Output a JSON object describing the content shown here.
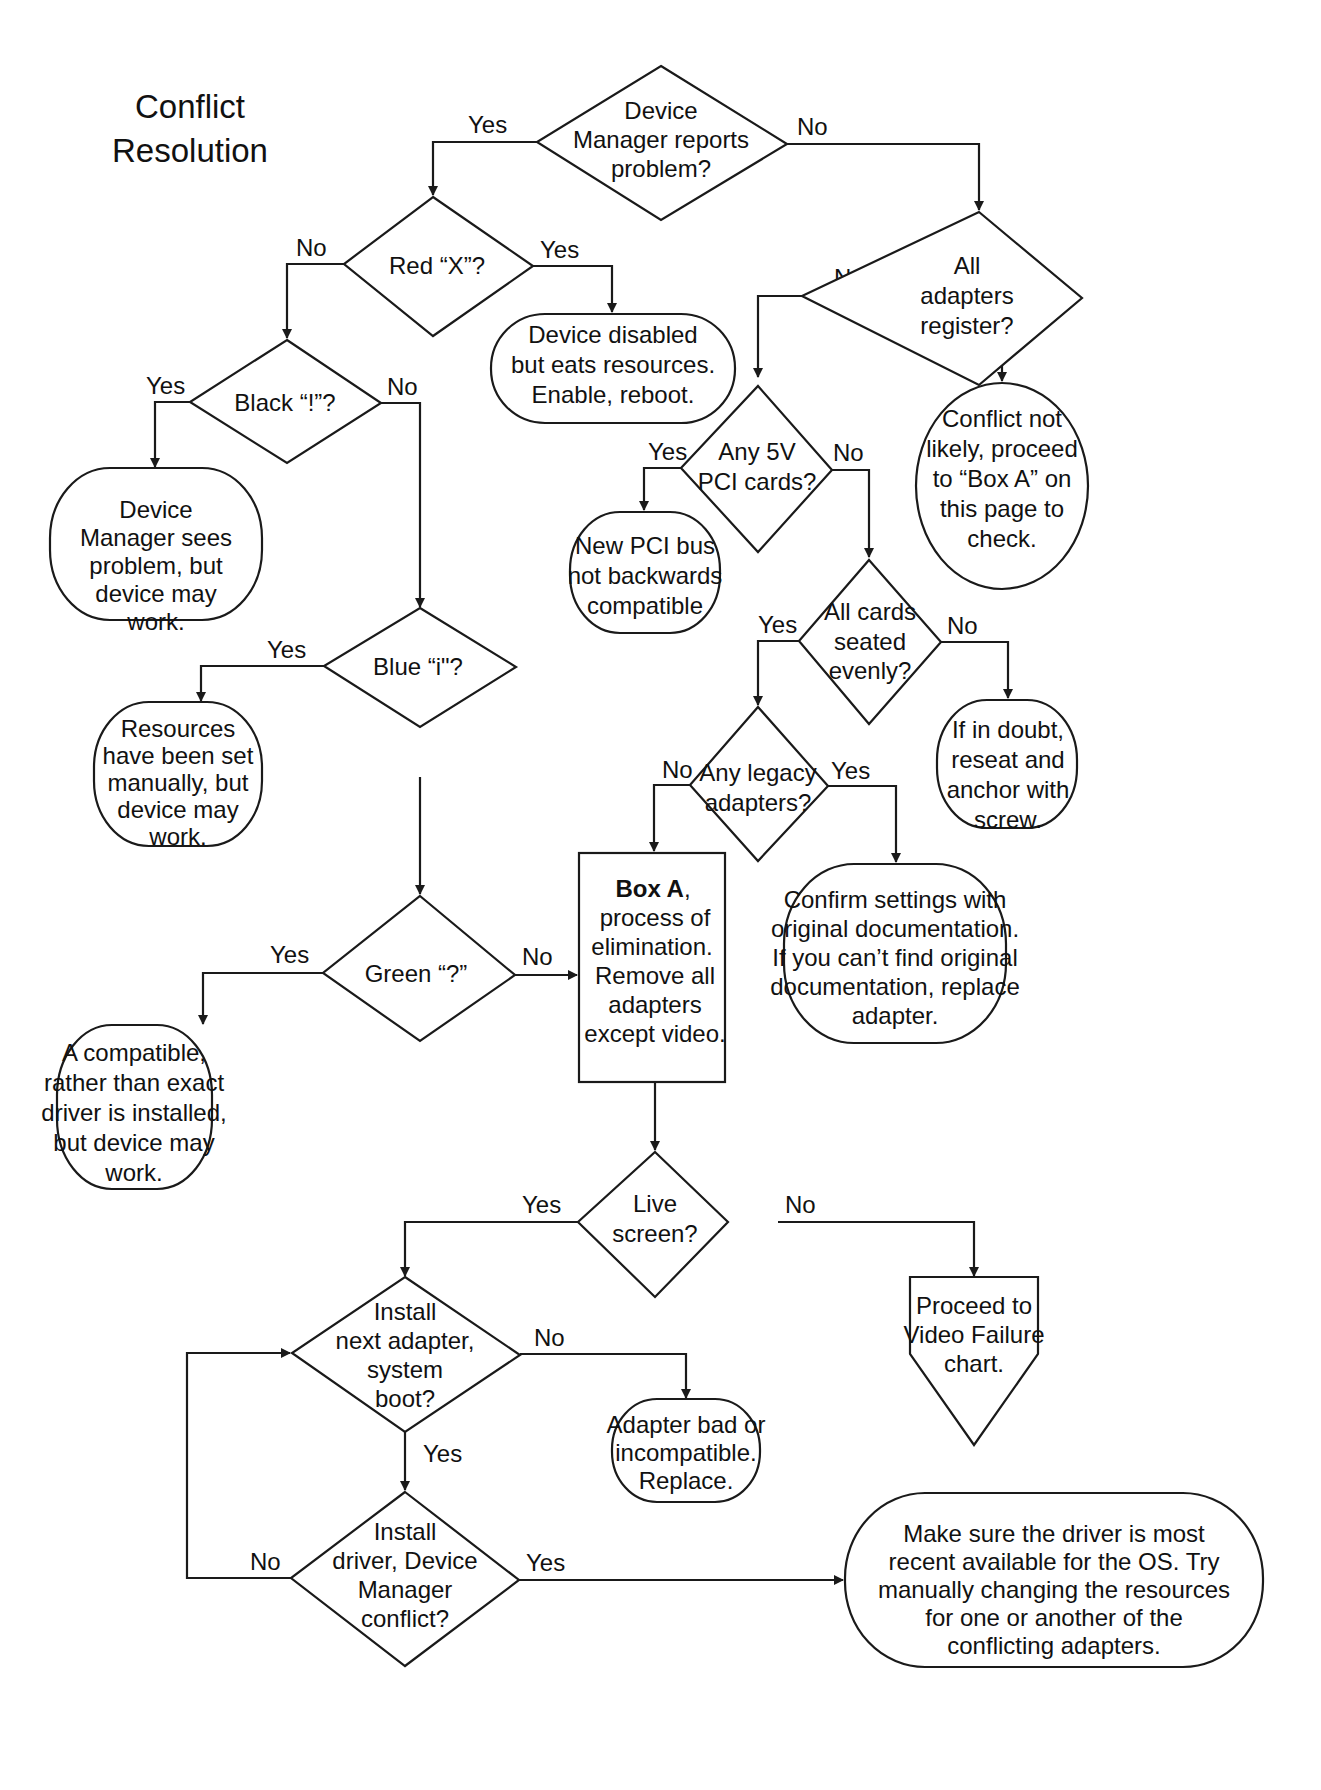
{
  "title": {
    "line1": "Conflict",
    "line2": "Resolution"
  },
  "colors": {
    "stroke": "#1a1a1a",
    "fill": "#ffffff",
    "text": "#111111"
  },
  "nodes": {
    "dm_reports": {
      "type": "decision",
      "lines": [
        "Device",
        "Manager reports",
        "problem?"
      ]
    },
    "red_x": {
      "type": "decision",
      "lines": [
        "Red “X”?"
      ]
    },
    "device_disabled": {
      "type": "terminal",
      "lines": [
        "Device disabled",
        "but eats resources.",
        "Enable, reboot."
      ]
    },
    "black_bang": {
      "type": "decision",
      "lines": [
        "Black “!”?"
      ]
    },
    "dm_sees_problem": {
      "type": "terminal",
      "lines": [
        "Device",
        "Manager sees",
        "problem, but",
        "device may",
        "work."
      ]
    },
    "blue_i": {
      "type": "decision",
      "lines": [
        "Blue “i\"?"
      ]
    },
    "resources_manual": {
      "type": "terminal",
      "lines": [
        "Resources",
        "have been set",
        "manually, but",
        "device may",
        "work."
      ]
    },
    "green_q": {
      "type": "decision",
      "lines": [
        "Green “?”"
      ]
    },
    "compatible_driver": {
      "type": "terminal",
      "lines": [
        "A compatible,",
        "rather than exact",
        "driver is installed,",
        "but device may",
        "work."
      ]
    },
    "all_adapters_register": {
      "type": "decision",
      "lines": [
        "All",
        "adapters",
        "register?"
      ]
    },
    "conflict_not_likely": {
      "type": "terminal",
      "lines": [
        "Conflict not",
        "likely, proceed",
        "to “Box A” on",
        "this page to",
        "check."
      ]
    },
    "any_5v_pci": {
      "type": "decision",
      "lines": [
        "Any 5V",
        "PCI cards?"
      ]
    },
    "new_pci_bus": {
      "type": "terminal",
      "lines": [
        "New PCI bus",
        "not backwards",
        "compatible"
      ]
    },
    "cards_seated": {
      "type": "decision",
      "lines": [
        "All cards",
        "seated",
        "evenly?"
      ]
    },
    "reseat": {
      "type": "terminal",
      "lines": [
        "If in doubt,",
        "reseat and",
        "anchor with",
        "screw."
      ]
    },
    "legacy_adapters": {
      "type": "decision",
      "lines": [
        "Any legacy",
        "adapters?"
      ]
    },
    "box_a": {
      "type": "process",
      "bold": "Box A",
      "first_rest": ",",
      "lines": [
        "process of",
        "elimination.",
        "Remove all",
        "adapters",
        "except video."
      ]
    },
    "confirm_settings": {
      "type": "terminal",
      "lines": [
        "Confirm settings with",
        "original documentation.",
        "If you can’t find original",
        "documentation, replace",
        "adapter."
      ]
    },
    "live_screen": {
      "type": "decision",
      "lines": [
        "Live",
        "screen?"
      ]
    },
    "video_failure": {
      "type": "offpage",
      "lines": [
        "Proceed to",
        "Video Failure",
        "chart."
      ]
    },
    "install_next": {
      "type": "decision",
      "lines": [
        "Install",
        "next adapter,",
        "system",
        "boot?"
      ]
    },
    "adapter_bad": {
      "type": "terminal",
      "lines": [
        "Adapter bad or",
        "incompatible.",
        "Replace."
      ]
    },
    "install_driver": {
      "type": "decision",
      "lines": [
        "Install",
        "driver, Device",
        "Manager",
        "conflict?"
      ]
    },
    "make_sure_driver": {
      "type": "terminal",
      "lines": [
        "Make sure the driver is most",
        "recent available for the OS. Try",
        "manually changing the resources",
        "for one or another of the",
        "conflicting adapters."
      ]
    }
  },
  "edges": {
    "dm_yes": "Yes",
    "dm_no": "No",
    "redx_no": "No",
    "redx_yes": "Yes",
    "black_yes": "Yes",
    "black_no": "No",
    "blue_yes": "Yes",
    "green_yes": "Yes",
    "green_no": "No",
    "register_no": "No",
    "register_yes": "Yes",
    "pci_yes": "Yes",
    "pci_no": "No",
    "seated_yes": "Yes",
    "seated_no": "No",
    "legacy_no": "No",
    "legacy_yes": "Yes",
    "live_yes": "Yes",
    "live_no": "No",
    "next_no": "No",
    "next_yes": "Yes",
    "driver_no": "No",
    "driver_yes": "Yes"
  }
}
